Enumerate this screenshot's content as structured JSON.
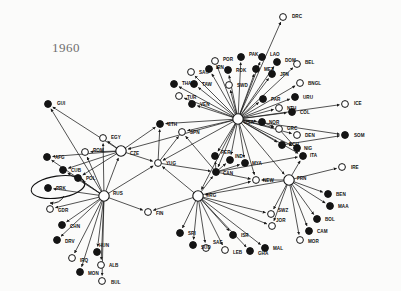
{
  "figure": {
    "year_label": "1960",
    "type": "network-graph",
    "background_color": "#fbfbfa",
    "node_fill_solid": "#141414",
    "node_fill_hollow": "#ffffff",
    "node_stroke": "#141414",
    "edge_color": "#1a1a1a",
    "label_color": "#111111",
    "highlight_shape": "ellipse",
    "highlighted_node": "PRK"
  },
  "chart_data": {
    "type": "scatter",
    "title": "1960",
    "xlabel": "",
    "ylabel": "",
    "hubs": [
      "USA",
      "RUS",
      "FRN",
      "URG",
      "CZE"
    ],
    "nodes": [
      {
        "id": "DRC",
        "x": 283,
        "y": 17,
        "fill": "hollow",
        "label_dx": 9,
        "label_dy": -1
      },
      {
        "id": "GUI",
        "x": 48,
        "y": 104,
        "fill": "solid",
        "label_dx": 9,
        "label_dy": -1
      },
      {
        "id": "POR",
        "x": 215,
        "y": 61,
        "fill": "hollow",
        "label_dx": 8,
        "label_dy": -2
      },
      {
        "id": "PAK",
        "x": 241,
        "y": 57,
        "fill": "solid",
        "label_dx": 8,
        "label_dy": -3
      },
      {
        "id": "LAO",
        "x": 262,
        "y": 57,
        "fill": "solid",
        "label_dx": 8,
        "label_dy": -3
      },
      {
        "id": "DOM",
        "x": 277,
        "y": 62,
        "fill": "solid",
        "label_dx": 8,
        "label_dy": -2
      },
      {
        "id": "BEL",
        "x": 297,
        "y": 64,
        "fill": "hollow",
        "label_dx": 8,
        "label_dy": -2
      },
      {
        "id": "SAU",
        "x": 191,
        "y": 72,
        "fill": "hollow",
        "label_dx": 8,
        "label_dy": 0
      },
      {
        "id": "IRN",
        "x": 209,
        "y": 69,
        "fill": "solid",
        "label_dx": 7,
        "label_dy": -2
      },
      {
        "id": "ROK",
        "x": 228,
        "y": 70,
        "fill": "solid",
        "label_dx": 8,
        "label_dy": 0
      },
      {
        "id": "MEX",
        "x": 256,
        "y": 69,
        "fill": "solid",
        "label_dx": 8,
        "label_dy": 0
      },
      {
        "id": "JPN",
        "x": 272,
        "y": 74,
        "fill": "solid",
        "label_dx": 8,
        "label_dy": 0
      },
      {
        "id": "THA",
        "x": 174,
        "y": 84,
        "fill": "solid",
        "label_dx": 8,
        "label_dy": -1
      },
      {
        "id": "TAW",
        "x": 194,
        "y": 84,
        "fill": "solid",
        "label_dx": 8,
        "label_dy": 0
      },
      {
        "id": "SWD",
        "x": 229,
        "y": 85,
        "fill": "hollow",
        "label_dx": 8,
        "label_dy": 0
      },
      {
        "id": "BNGL",
        "x": 300,
        "y": 83,
        "fill": "hollow",
        "label_dx": 8,
        "label_dy": 0
      },
      {
        "id": "URU",
        "x": 295,
        "y": 97,
        "fill": "solid",
        "label_dx": 8,
        "label_dy": 0
      },
      {
        "id": "TUR",
        "x": 179,
        "y": 96,
        "fill": "hollow",
        "label_dx": 8,
        "label_dy": 1
      },
      {
        "id": "VEN",
        "x": 192,
        "y": 104,
        "fill": "solid",
        "label_dx": 8,
        "label_dy": 0
      },
      {
        "id": "PAR",
        "x": 263,
        "y": 99,
        "fill": "solid",
        "label_dx": 8,
        "label_dy": 0
      },
      {
        "id": "NTH",
        "x": 279,
        "y": 108,
        "fill": "hollow",
        "label_dx": 8,
        "label_dy": 0
      },
      {
        "id": "COL",
        "x": 292,
        "y": 112,
        "fill": "solid",
        "label_dx": 8,
        "label_dy": 0
      },
      {
        "id": "ICE",
        "x": 345,
        "y": 104,
        "fill": "hollow",
        "label_dx": 9,
        "label_dy": -1
      },
      {
        "id": "USA",
        "x": 238,
        "y": 119,
        "fill": "hollow",
        "label_dx": 6,
        "label_dy": 3,
        "hub": true
      },
      {
        "id": "NOR",
        "x": 262,
        "y": 122,
        "fill": "solid",
        "label_dx": 7,
        "label_dy": 0
      },
      {
        "id": "GRC",
        "x": 279,
        "y": 129,
        "fill": "hollow",
        "label_dx": 8,
        "label_dy": -1
      },
      {
        "id": "DEN",
        "x": 297,
        "y": 135,
        "fill": "hollow",
        "label_dx": 8,
        "label_dy": 0
      },
      {
        "id": "ECU",
        "x": 282,
        "y": 145,
        "fill": "solid",
        "label_dx": 7,
        "label_dy": -1
      },
      {
        "id": "NIG",
        "x": 297,
        "y": 148,
        "fill": "solid",
        "label_dx": 7,
        "label_dy": 0
      },
      {
        "id": "SOM",
        "x": 345,
        "y": 135,
        "fill": "solid",
        "label_dx": 9,
        "label_dy": 0
      },
      {
        "id": "ETH",
        "x": 160,
        "y": 124,
        "fill": "solid",
        "label_dx": 8,
        "label_dy": 0
      },
      {
        "id": "SPN",
        "x": 182,
        "y": 132,
        "fill": "hollow",
        "label_dx": 8,
        "label_dy": 0
      },
      {
        "id": "EGY",
        "x": 103,
        "y": 138,
        "fill": "hollow",
        "label_dx": 8,
        "label_dy": -1
      },
      {
        "id": "ROM",
        "x": 85,
        "y": 152,
        "fill": "hollow",
        "label_dx": 8,
        "label_dy": -2
      },
      {
        "id": "AFG",
        "x": 47,
        "y": 157,
        "fill": "solid",
        "label_dx": 8,
        "label_dy": 0
      },
      {
        "id": "CZE",
        "x": 121,
        "y": 151,
        "fill": "hollow",
        "label_dx": 9,
        "label_dy": 2,
        "hub": true
      },
      {
        "id": "CUB",
        "x": 63,
        "y": 170,
        "fill": "solid",
        "label_dx": 8,
        "label_dy": 0
      },
      {
        "id": "POL",
        "x": 78,
        "y": 178,
        "fill": "solid",
        "label_dx": 8,
        "label_dy": 0
      },
      {
        "id": "PRK",
        "x": 48,
        "y": 188,
        "fill": "solid",
        "label_dx": 8,
        "label_dy": 0
      },
      {
        "id": "RUS",
        "x": 104,
        "y": 196,
        "fill": "hollow",
        "label_dx": 9,
        "label_dy": -3,
        "hub": true
      },
      {
        "id": "GDR",
        "x": 50,
        "y": 209,
        "fill": "hollow",
        "label_dx": 8,
        "label_dy": 1
      },
      {
        "id": "CHN",
        "x": 62,
        "y": 225,
        "fill": "solid",
        "label_dx": 8,
        "label_dy": 1
      },
      {
        "id": "DRV",
        "x": 57,
        "y": 240,
        "fill": "solid",
        "label_dx": 8,
        "label_dy": 1
      },
      {
        "id": "IRQ",
        "x": 72,
        "y": 258,
        "fill": "hollow",
        "label_dx": 8,
        "label_dy": 2
      },
      {
        "id": "HUN",
        "x": 97,
        "y": 252,
        "fill": "solid",
        "label_dx": 2,
        "label_dy": -7
      },
      {
        "id": "ALB",
        "x": 101,
        "y": 265,
        "fill": "hollow",
        "label_dx": 8,
        "label_dy": 0
      },
      {
        "id": "MON",
        "x": 80,
        "y": 272,
        "fill": "solid",
        "label_dx": 8,
        "label_dy": 1
      },
      {
        "id": "BUL",
        "x": 102,
        "y": 281,
        "fill": "hollow",
        "label_dx": 9,
        "label_dy": 1
      },
      {
        "id": "FIN",
        "x": 148,
        "y": 212,
        "fill": "hollow",
        "label_dx": 8,
        "label_dy": 1
      },
      {
        "id": "YUG",
        "x": 158,
        "y": 163,
        "fill": "hollow",
        "label_dx": 8,
        "label_dy": 0
      },
      {
        "id": "PER",
        "x": 215,
        "y": 156,
        "fill": "solid",
        "label_dx": 6,
        "label_dy": -4
      },
      {
        "id": "IND",
        "x": 230,
        "y": 160,
        "fill": "solid",
        "label_dx": 5,
        "label_dy": -4
      },
      {
        "id": "MYA",
        "x": 245,
        "y": 163,
        "fill": "solid",
        "label_dx": 7,
        "label_dy": 0
      },
      {
        "id": "ITA",
        "x": 303,
        "y": 156,
        "fill": "solid",
        "label_dx": 7,
        "label_dy": -1
      },
      {
        "id": "CAN",
        "x": 216,
        "y": 172,
        "fill": "solid",
        "label_dx": 7,
        "label_dy": 1
      },
      {
        "id": "NEW",
        "x": 256,
        "y": 180,
        "fill": "hollow",
        "label_dx": 7,
        "label_dy": 0
      },
      {
        "id": "FRN",
        "x": 289,
        "y": 180,
        "fill": "hollow",
        "label_dx": 8,
        "label_dy": -2,
        "hub": true
      },
      {
        "id": "IRE",
        "x": 342,
        "y": 167,
        "fill": "hollow",
        "label_dx": 9,
        "label_dy": 0
      },
      {
        "id": "BEN",
        "x": 328,
        "y": 194,
        "fill": "solid",
        "label_dx": 8,
        "label_dy": 0
      },
      {
        "id": "MAA",
        "x": 330,
        "y": 206,
        "fill": "solid",
        "label_dx": 8,
        "label_dy": 0
      },
      {
        "id": "BOL",
        "x": 317,
        "y": 219,
        "fill": "solid",
        "label_dx": 8,
        "label_dy": 0
      },
      {
        "id": "CAM",
        "x": 309,
        "y": 231,
        "fill": "solid",
        "label_dx": 8,
        "label_dy": 0
      },
      {
        "id": "MOR",
        "x": 300,
        "y": 240,
        "fill": "hollow",
        "label_dx": 8,
        "label_dy": 1
      },
      {
        "id": "URG",
        "x": 198,
        "y": 196,
        "fill": "hollow",
        "label_dx": 8,
        "label_dy": -1,
        "hub": true
      },
      {
        "id": "SWZ",
        "x": 271,
        "y": 214,
        "fill": "hollow",
        "label_dx": 7,
        "label_dy": -4
      },
      {
        "id": "JOR",
        "x": 272,
        "y": 226,
        "fill": "hollow",
        "label_dx": 4,
        "label_dy": -6
      },
      {
        "id": "SRI",
        "x": 180,
        "y": 233,
        "fill": "solid",
        "label_dx": 8,
        "label_dy": 0
      },
      {
        "id": "SUD",
        "x": 193,
        "y": 245,
        "fill": "solid",
        "label_dx": 8,
        "label_dy": 2
      },
      {
        "id": "SAF",
        "x": 206,
        "y": 248,
        "fill": "hollow",
        "label_dx": 7,
        "label_dy": -6
      },
      {
        "id": "ISR",
        "x": 233,
        "y": 235,
        "fill": "solid",
        "label_dx": 8,
        "label_dy": 0
      },
      {
        "id": "LEB",
        "x": 225,
        "y": 250,
        "fill": "hollow",
        "label_dx": 8,
        "label_dy": 2
      },
      {
        "id": "GHA",
        "x": 250,
        "y": 251,
        "fill": "solid",
        "label_dx": 8,
        "label_dy": 2
      },
      {
        "id": "MAL",
        "x": 265,
        "y": 248,
        "fill": "solid",
        "label_dx": 8,
        "label_dy": 0
      }
    ],
    "edges": [
      {
        "from": "USA",
        "to": "DRC"
      },
      {
        "from": "USA",
        "to": "POR"
      },
      {
        "from": "USA",
        "to": "PAK"
      },
      {
        "from": "USA",
        "to": "LAO"
      },
      {
        "from": "USA",
        "to": "DOM"
      },
      {
        "from": "USA",
        "to": "BEL"
      },
      {
        "from": "USA",
        "to": "SAU"
      },
      {
        "from": "USA",
        "to": "IRN"
      },
      {
        "from": "USA",
        "to": "ROK"
      },
      {
        "from": "USA",
        "to": "MEX"
      },
      {
        "from": "USA",
        "to": "JPN"
      },
      {
        "from": "USA",
        "to": "THA"
      },
      {
        "from": "USA",
        "to": "TAW"
      },
      {
        "from": "USA",
        "to": "SWD"
      },
      {
        "from": "USA",
        "to": "BNGL"
      },
      {
        "from": "USA",
        "to": "URU"
      },
      {
        "from": "USA",
        "to": "TUR"
      },
      {
        "from": "USA",
        "to": "VEN"
      },
      {
        "from": "USA",
        "to": "PAR"
      },
      {
        "from": "USA",
        "to": "NTH"
      },
      {
        "from": "USA",
        "to": "COL"
      },
      {
        "from": "USA",
        "to": "ICE"
      },
      {
        "from": "USA",
        "to": "NOR"
      },
      {
        "from": "USA",
        "to": "GRC"
      },
      {
        "from": "USA",
        "to": "DEN"
      },
      {
        "from": "USA",
        "to": "ECU"
      },
      {
        "from": "USA",
        "to": "NIG"
      },
      {
        "from": "USA",
        "to": "SOM"
      },
      {
        "from": "USA",
        "to": "ETH"
      },
      {
        "from": "USA",
        "to": "SPN"
      },
      {
        "from": "USA",
        "to": "YUG"
      },
      {
        "from": "USA",
        "to": "PER"
      },
      {
        "from": "USA",
        "to": "IND"
      },
      {
        "from": "USA",
        "to": "MYA"
      },
      {
        "from": "USA",
        "to": "ITA"
      },
      {
        "from": "USA",
        "to": "CAN"
      },
      {
        "from": "USA",
        "to": "NEW"
      },
      {
        "from": "USA",
        "to": "FRN"
      },
      {
        "from": "USA",
        "to": "URG"
      },
      {
        "from": "USA",
        "to": "CZE"
      },
      {
        "from": "RUS",
        "to": "AFG"
      },
      {
        "from": "RUS",
        "to": "CUB"
      },
      {
        "from": "RUS",
        "to": "POL"
      },
      {
        "from": "RUS",
        "to": "PRK"
      },
      {
        "from": "RUS",
        "to": "GDR"
      },
      {
        "from": "RUS",
        "to": "CHN"
      },
      {
        "from": "RUS",
        "to": "DRV"
      },
      {
        "from": "RUS",
        "to": "IRQ"
      },
      {
        "from": "RUS",
        "to": "HUN"
      },
      {
        "from": "RUS",
        "to": "ALB"
      },
      {
        "from": "RUS",
        "to": "MON"
      },
      {
        "from": "RUS",
        "to": "BUL"
      },
      {
        "from": "RUS",
        "to": "ROM"
      },
      {
        "from": "RUS",
        "to": "CZE"
      },
      {
        "from": "RUS",
        "to": "FIN"
      },
      {
        "from": "RUS",
        "to": "EGY"
      },
      {
        "from": "RUS",
        "to": "GUI"
      },
      {
        "from": "RUS",
        "to": "YUG"
      },
      {
        "from": "CZE",
        "to": "EGY"
      },
      {
        "from": "CZE",
        "to": "ROM"
      },
      {
        "from": "CZE",
        "to": "GUI"
      },
      {
        "from": "CZE",
        "to": "CUB"
      },
      {
        "from": "CZE",
        "to": "POL"
      },
      {
        "from": "CZE",
        "to": "AFG"
      },
      {
        "from": "CZE",
        "to": "YUG"
      },
      {
        "from": "CZE",
        "to": "ETH"
      },
      {
        "from": "FRN",
        "to": "IRE"
      },
      {
        "from": "FRN",
        "to": "BEN"
      },
      {
        "from": "FRN",
        "to": "MAA"
      },
      {
        "from": "FRN",
        "to": "BOL"
      },
      {
        "from": "FRN",
        "to": "CAM"
      },
      {
        "from": "FRN",
        "to": "MOR"
      },
      {
        "from": "FRN",
        "to": "SWZ"
      },
      {
        "from": "FRN",
        "to": "JOR"
      },
      {
        "from": "FRN",
        "to": "NEW"
      },
      {
        "from": "FRN",
        "to": "ITA"
      },
      {
        "from": "FRN",
        "to": "URG"
      },
      {
        "from": "URG",
        "to": "SRI"
      },
      {
        "from": "URG",
        "to": "SUD"
      },
      {
        "from": "URG",
        "to": "SAF"
      },
      {
        "from": "URG",
        "to": "ISR"
      },
      {
        "from": "URG",
        "to": "LEB"
      },
      {
        "from": "URG",
        "to": "GHA"
      },
      {
        "from": "URG",
        "to": "MAL"
      },
      {
        "from": "URG",
        "to": "SWZ"
      },
      {
        "from": "URG",
        "to": "JOR"
      },
      {
        "from": "URG",
        "to": "CAN"
      },
      {
        "from": "URG",
        "to": "FIN"
      },
      {
        "from": "URG",
        "to": "NEW"
      },
      {
        "from": "URG",
        "to": "YUG"
      },
      {
        "from": "CAN",
        "to": "PER"
      },
      {
        "from": "CAN",
        "to": "IND"
      },
      {
        "from": "CAN",
        "to": "MYA"
      },
      {
        "from": "CAN",
        "to": "NEW"
      },
      {
        "from": "CAN",
        "to": "SPN"
      },
      {
        "from": "CAN",
        "to": "ITA"
      },
      {
        "from": "YUG",
        "to": "ETH"
      },
      {
        "from": "YUG",
        "to": "SPN"
      },
      {
        "from": "YUG",
        "to": "CAN"
      },
      {
        "from": "ECU",
        "to": "SOM"
      },
      {
        "from": "GRC",
        "to": "ITA"
      },
      {
        "from": "NOR",
        "to": "GRC"
      }
    ]
  }
}
